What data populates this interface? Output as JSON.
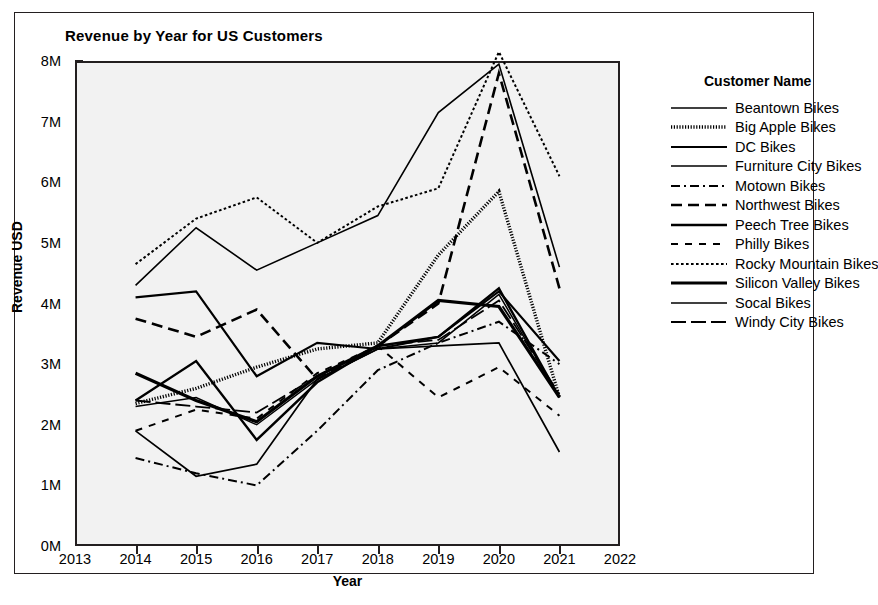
{
  "chart_data": {
    "type": "line",
    "title": "Revenue by Year for US Customers",
    "xlabel": "Year",
    "ylabel": "Revenue USD",
    "legend_title": "Customer Name",
    "legend_position": "right",
    "grid": false,
    "x": [
      2014,
      2015,
      2016,
      2017,
      2018,
      2019,
      2020,
      2021
    ],
    "xlim": [
      2013,
      2022
    ],
    "xticks": [
      "2013",
      "2014",
      "2015",
      "2016",
      "2017",
      "2018",
      "2019",
      "2020",
      "2021",
      "2022"
    ],
    "ylim": [
      0,
      8
    ],
    "yticks": [
      "0M",
      "1M",
      "2M",
      "3M",
      "4M",
      "5M",
      "6M",
      "7M",
      "8M"
    ],
    "ytick_values": [
      0,
      1,
      2,
      3,
      4,
      5,
      6,
      7,
      8
    ],
    "y_unit": "M",
    "series": [
      {
        "name": "Beantown Bikes",
        "style": "solid-thin",
        "values": [
          4.3,
          5.25,
          4.55,
          5.0,
          5.45,
          7.15,
          7.95,
          4.6
        ]
      },
      {
        "name": "Big Apple Bikes",
        "style": "dotted-thick",
        "values": [
          2.35,
          2.6,
          2.95,
          3.25,
          3.35,
          4.8,
          5.85,
          2.45
        ]
      },
      {
        "name": "DC Bikes",
        "style": "solid-med",
        "values": [
          4.1,
          4.2,
          2.8,
          3.35,
          3.25,
          3.45,
          4.2,
          3.05
        ]
      },
      {
        "name": "Furniture City Bikes",
        "style": "solid-thin2",
        "values": [
          2.3,
          2.45,
          2.0,
          2.75,
          3.25,
          3.35,
          4.15,
          2.45
        ]
      },
      {
        "name": "Motown Bikes",
        "style": "dash-dot",
        "values": [
          1.45,
          1.2,
          1.0,
          1.9,
          2.9,
          3.35,
          3.7,
          3.0
        ]
      },
      {
        "name": "Northwest Bikes",
        "style": "dash-long",
        "values": [
          3.75,
          3.45,
          3.9,
          2.75,
          3.3,
          4.0,
          7.8,
          4.25
        ]
      },
      {
        "name": "Peech Tree Bikes",
        "style": "solid-med2",
        "values": [
          2.4,
          3.05,
          1.75,
          2.7,
          3.3,
          3.45,
          4.25,
          2.45
        ]
      },
      {
        "name": "Philly Bikes",
        "style": "dash-short",
        "values": [
          1.9,
          2.25,
          2.1,
          2.85,
          3.3,
          2.45,
          2.95,
          2.15
        ]
      },
      {
        "name": "Rocky Mountain Bikes",
        "style": "dotted-fine",
        "values": [
          4.65,
          5.4,
          5.75,
          5.0,
          5.6,
          5.9,
          8.15,
          6.1
        ]
      },
      {
        "name": "Silicon Valley Bikes",
        "style": "solid-thick",
        "values": [
          2.85,
          2.4,
          2.05,
          2.8,
          3.3,
          4.05,
          3.95,
          2.45
        ]
      },
      {
        "name": "Socal Bikes",
        "style": "solid-thin3",
        "values": [
          1.9,
          1.15,
          1.35,
          2.75,
          3.25,
          3.3,
          3.35,
          1.55
        ]
      },
      {
        "name": "Windy City Bikes",
        "style": "dash-dash",
        "values": [
          2.4,
          2.3,
          2.2,
          2.8,
          3.3,
          3.4,
          4.05,
          2.5
        ]
      }
    ]
  }
}
